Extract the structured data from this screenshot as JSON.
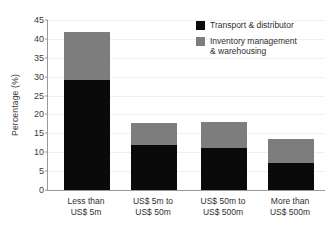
{
  "chart_data": {
    "type": "bar",
    "stacked": true,
    "title": "",
    "subtitle": "",
    "xlabel": "",
    "ylabel": "Percentage (%)",
    "ylim": [
      0,
      45
    ],
    "ytick_step": 5,
    "yticks": [
      0,
      5,
      10,
      15,
      20,
      25,
      30,
      35,
      40,
      45
    ],
    "ytick_labels": [
      "0",
      "5",
      "10",
      "15",
      "20",
      "25",
      "30",
      "35",
      "40",
      "45"
    ],
    "grid": "horizontal",
    "legend_position": "top-right",
    "categories": [
      "Less than\nUS$ 5m",
      "US$ 5m to\nUS$ 50m",
      "US$ 50m to\nUS$ 500m",
      "More than\nUS$ 500m"
    ],
    "series": [
      {
        "name": "Transport & distributor",
        "color": "#0a0a0a",
        "values": [
          29.2,
          11.9,
          11.2,
          7.2
        ]
      },
      {
        "name": "Inventory management\n& warehousing",
        "color": "#7d7d7d",
        "values": [
          12.6,
          5.8,
          6.8,
          6.3
        ]
      }
    ],
    "totals": [
      41.8,
      17.7,
      18.0,
      13.5
    ],
    "annotations": []
  },
  "legend": {
    "items": [
      {
        "label": "Transport & distributor",
        "swatch": "black-swatch-icon"
      },
      {
        "label": "Inventory management\n& warehousing",
        "swatch": "gray-swatch-icon"
      }
    ]
  }
}
